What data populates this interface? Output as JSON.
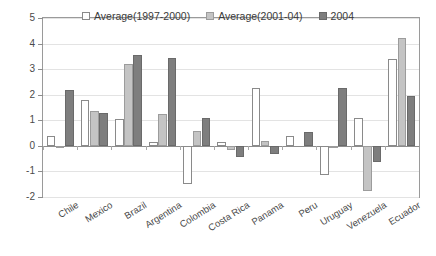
{
  "chart_data": {
    "type": "bar",
    "title": "",
    "subtitle": "",
    "xlabel": "",
    "ylabel": "",
    "ylim": [
      -2,
      5
    ],
    "yticks": [
      5,
      4,
      3,
      2,
      1,
      0,
      -1,
      -2
    ],
    "ytick_labels": [
      "5",
      "4",
      "3",
      "2",
      "1",
      "0",
      "-1",
      "-2"
    ],
    "grid": true,
    "legend_position": "top-center",
    "categories": [
      "Chile",
      "Mexico",
      "Brazil",
      "Argentina",
      "Colombia",
      "Costa Rica",
      "Panama",
      "Peru",
      "Uruguay",
      "Venezuela",
      "Ecuador"
    ],
    "series": [
      {
        "name": "Average(1997-2000)",
        "color": "#ffffff",
        "values": [
          0.4,
          1.8,
          1.05,
          0.15,
          -1.5,
          0.15,
          2.25,
          0.4,
          -1.15,
          1.1,
          3.4
        ]
      },
      {
        "name": "Average(2001-04)",
        "color": "#c4c4c4",
        "values": [
          -0.1,
          1.35,
          3.2,
          1.25,
          0.6,
          -0.15,
          0.2,
          0.0,
          -0.1,
          -1.75,
          4.2
        ]
      },
      {
        "name": "2004",
        "color": "#7e7e7e",
        "values": [
          2.2,
          1.3,
          3.55,
          3.45,
          1.1,
          -0.45,
          -0.3,
          0.55,
          2.25,
          -0.65,
          1.95
        ]
      }
    ]
  },
  "legend": {
    "items": [
      {
        "label": "Average(1997-2000)"
      },
      {
        "label": "Average(2001-04)"
      },
      {
        "label": "2004"
      }
    ]
  }
}
